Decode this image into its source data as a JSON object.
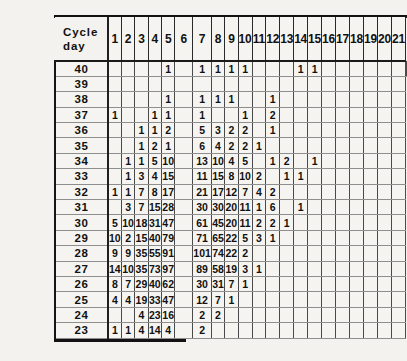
{
  "header": {
    "corner_label_line1": "Cycle",
    "corner_label_line2": "day",
    "vertical_axis_label": "Duration of cycle",
    "columns": [
      "1",
      "2",
      "3",
      "4",
      "5",
      "6",
      "7",
      "8",
      "9",
      "10",
      "11",
      "12",
      "13",
      "14",
      "15",
      "16",
      "17",
      "18",
      "19",
      "20",
      "21"
    ]
  },
  "chart_data": {
    "type": "table",
    "title": "",
    "xlabel": "Cycle day",
    "ylabel": "Duration of cycle",
    "categories": [
      "1",
      "2",
      "3",
      "4",
      "5",
      "6",
      "7",
      "8",
      "9",
      "10",
      "11",
      "12",
      "13",
      "14",
      "15",
      "16",
      "17",
      "18",
      "19",
      "20",
      "21"
    ],
    "row_labels": [
      "40",
      "39",
      "38",
      "37",
      "36",
      "35",
      "34",
      "33",
      "32",
      "31",
      "30",
      "29",
      "28",
      "27",
      "26",
      "25",
      "24",
      "23"
    ],
    "rows": [
      {
        "label": "40",
        "values": [
          "",
          "",
          "",
          "",
          "1",
          "",
          "1",
          "1",
          "1",
          "1",
          "",
          "",
          "",
          "1",
          "1",
          "",
          "",
          "",
          "",
          "",
          "",
          ""
        ]
      },
      {
        "label": "39",
        "values": [
          "",
          "",
          "",
          "",
          "",
          "",
          "",
          "",
          "",
          "",
          "",
          "",
          "",
          "",
          "",
          "",
          "",
          "",
          "",
          "",
          ""
        ]
      },
      {
        "label": "38",
        "values": [
          "",
          "",
          "",
          "",
          "1",
          "",
          "1",
          "1",
          "1",
          "",
          "",
          "1",
          "",
          "",
          "",
          "",
          "",
          "",
          "",
          "",
          ""
        ]
      },
      {
        "label": "37",
        "values": [
          "1",
          "",
          "",
          "1",
          "1",
          "",
          "1",
          "",
          "",
          "1",
          "",
          "2",
          "",
          "",
          "",
          "",
          "",
          "",
          "",
          "",
          ""
        ]
      },
      {
        "label": "36",
        "values": [
          "",
          "",
          "1",
          "1",
          "2",
          "",
          "5",
          "3",
          "2",
          "2",
          "",
          "1",
          "",
          "",
          "",
          "",
          "",
          "",
          "",
          "",
          ""
        ]
      },
      {
        "label": "35",
        "values": [
          "",
          "",
          "1",
          "2",
          "1",
          "",
          "6",
          "4",
          "2",
          "2",
          "1",
          "",
          "",
          "",
          "",
          "",
          "",
          "",
          "",
          "",
          ""
        ]
      },
      {
        "label": "34",
        "values": [
          "",
          "1",
          "1",
          "5",
          "10",
          "",
          "13",
          "10",
          "4",
          "5",
          "",
          "1",
          "2",
          "",
          "1",
          "",
          "",
          "",
          "",
          "",
          ""
        ]
      },
      {
        "label": "33",
        "values": [
          "",
          "1",
          "3",
          "4",
          "15",
          "",
          "11",
          "15",
          "8",
          "10",
          "2",
          "",
          "1",
          "1",
          "",
          "",
          "",
          "",
          "",
          "",
          ""
        ]
      },
      {
        "label": "32",
        "values": [
          "1",
          "1",
          "7",
          "8",
          "17",
          "",
          "21",
          "17",
          "12",
          "7",
          "4",
          "2",
          "",
          "",
          "",
          "",
          "",
          "",
          "",
          "",
          ""
        ]
      },
      {
        "label": "31",
        "values": [
          "",
          "3",
          "7",
          "15",
          "28",
          "",
          "30",
          "30",
          "20",
          "11",
          "1",
          "6",
          "",
          "1",
          "",
          "",
          "",
          "",
          "",
          "",
          ""
        ]
      },
      {
        "label": "30",
        "values": [
          "5",
          "10",
          "18",
          "31",
          "47",
          "",
          "61",
          "45",
          "20",
          "11",
          "2",
          "2",
          "1",
          "",
          "",
          "",
          "",
          "",
          "",
          "",
          ""
        ]
      },
      {
        "label": "29",
        "values": [
          "10",
          "2",
          "15",
          "40",
          "79",
          "",
          "71",
          "65",
          "22",
          "5",
          "3",
          "1",
          "",
          "",
          "",
          "",
          "",
          "",
          "",
          "",
          ""
        ]
      },
      {
        "label": "28",
        "values": [
          "9",
          "9",
          "35",
          "55",
          "91",
          "",
          "101",
          "74",
          "22",
          "2",
          "",
          "",
          "",
          "",
          "",
          "",
          "",
          "",
          "",
          "",
          ""
        ]
      },
      {
        "label": "27",
        "values": [
          "14",
          "10",
          "35",
          "73",
          "97",
          "",
          "89",
          "58",
          "19",
          "3",
          "1",
          "",
          "",
          "",
          "",
          "",
          "",
          "",
          "",
          "",
          ""
        ]
      },
      {
        "label": "26",
        "values": [
          "8",
          "7",
          "29",
          "40",
          "62",
          "",
          "30",
          "31",
          "7",
          "1",
          "",
          "",
          "",
          "",
          "",
          "",
          "",
          "",
          "",
          "",
          ""
        ]
      },
      {
        "label": "25",
        "values": [
          "4",
          "4",
          "19",
          "33",
          "47",
          "",
          "12",
          "7",
          "1",
          "",
          "",
          "",
          "",
          "",
          "",
          "",
          "",
          "",
          "",
          "",
          ""
        ]
      },
      {
        "label": "24",
        "values": [
          "",
          "",
          "4",
          "23",
          "16",
          "",
          "2",
          "2",
          "",
          "",
          "",
          "",
          "",
          "",
          "",
          "",
          "",
          "",
          "",
          "",
          ""
        ]
      },
      {
        "label": "23",
        "values": [
          "1",
          "1",
          "4",
          "14",
          "4",
          "",
          "2",
          "",
          "",
          "",
          "",
          "",
          "",
          "",
          "",
          "",
          "",
          "",
          "",
          "",
          ""
        ]
      }
    ],
    "grid": true,
    "legend_position": "none"
  }
}
